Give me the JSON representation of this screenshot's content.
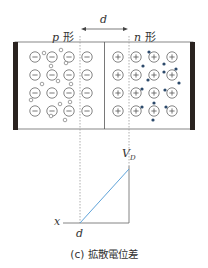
{
  "labels": {
    "p_region": "p 形",
    "n_region": "n 形",
    "depletion_width": "d",
    "potential": "V",
    "potential_sub": "D",
    "x_axis": "x",
    "d_tick": "d",
    "caption": "(c) 拡散電位差"
  },
  "colors": {
    "line": "#555555",
    "electrode": "#2a2320",
    "electron": "#2d4a6b",
    "potential_curve": "#5fa3d9",
    "dashed": "#999999"
  },
  "diagram": {
    "acceptor_ions": {
      "symbol": "minus",
      "columns": [
        35,
        52,
        69,
        87
      ],
      "rows": [
        57,
        75,
        93,
        111
      ]
    },
    "donor_ions": {
      "symbol": "plus",
      "columns": [
        118,
        136,
        154,
        172
      ],
      "rows": [
        57,
        75,
        93,
        111
      ]
    },
    "holes": [
      [
        44,
        53
      ],
      [
        61,
        50
      ],
      [
        51,
        66
      ],
      [
        66,
        63
      ],
      [
        42,
        84
      ],
      [
        58,
        81
      ],
      [
        71,
        84
      ],
      [
        31,
        100
      ],
      [
        60,
        104
      ],
      [
        70,
        102
      ],
      [
        51,
        116
      ],
      [
        65,
        120
      ]
    ],
    "electrons": [
      [
        149,
        52
      ],
      [
        143,
        66
      ],
      [
        164,
        64
      ],
      [
        176,
        69
      ],
      [
        148,
        80
      ],
      [
        164,
        72
      ],
      [
        179,
        83
      ],
      [
        142,
        89
      ],
      [
        165,
        90
      ],
      [
        142,
        107
      ],
      [
        154,
        103
      ],
      [
        166,
        107
      ],
      [
        153,
        120
      ]
    ]
  }
}
